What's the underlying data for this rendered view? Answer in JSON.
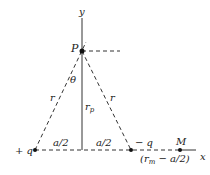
{
  "diagram": {
    "axes": {
      "y_label": "y",
      "x_label": "x"
    },
    "points": {
      "P": {
        "label": "P"
      },
      "plus_q": {
        "label": "+ q"
      },
      "minus_q": {
        "label": "− q"
      },
      "M": {
        "label": "M"
      }
    },
    "labels": {
      "theta": "θ",
      "r_left": "r",
      "r_right": "r",
      "r_p": "r",
      "r_p_sub": "p",
      "half_a_left": "a/2",
      "half_a_right": "a/2",
      "rm_open": "(r",
      "rm_sub": "m",
      "rm_rest": " − a/2)"
    },
    "colors": {
      "ink": "#222222",
      "background": "#ffffff"
    }
  }
}
